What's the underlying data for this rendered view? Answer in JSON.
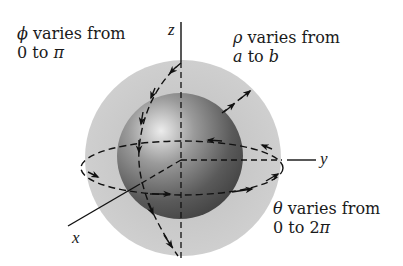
{
  "diagram": {
    "axes": {
      "z": "z",
      "y": "y",
      "x": "x"
    },
    "annotations": {
      "phi": {
        "symbol": "ϕ",
        "line1_rest": " varies from",
        "line2": "0 to ",
        "line2_sym": "π"
      },
      "rho": {
        "symbol": "ρ",
        "line1_rest": " varies from",
        "line2_a": "a",
        "line2_mid": " to ",
        "line2_b": "b"
      },
      "theta": {
        "symbol": "θ",
        "line1_rest": " varies from",
        "line2": "0 to 2",
        "line2_sym": "π"
      }
    },
    "colors": {
      "outer_shell": "#c8c8c8",
      "inner_sphere_dark": "#4a4a4a",
      "inner_sphere_highlight": "#e6e6e6",
      "lines": "#111111"
    }
  }
}
